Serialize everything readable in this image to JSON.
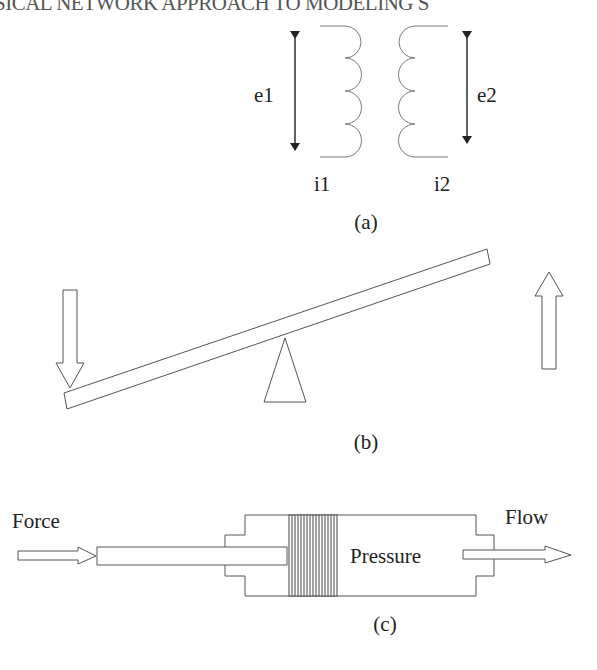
{
  "page": {
    "running_head": "SICAL NETWORK APPROACH TO MODELING S"
  },
  "figure": {
    "panel_a": {
      "caption": "(a)",
      "description": "transformer with two coupled coils",
      "labels": {
        "left_voltage": "e1",
        "right_voltage": "e2",
        "left_current": "i1",
        "right_current": "i2"
      }
    },
    "panel_b": {
      "caption": "(b)",
      "description": "lever on a fulcrum with downward input force on left end and upward output force on right end"
    },
    "panel_c": {
      "caption": "(c)",
      "description": "hydraulic piston: force pushes rod, piston produces pressure, fluid flows out",
      "labels": {
        "input": "Force",
        "chamber": "Pressure",
        "output": "Flow"
      }
    }
  },
  "colors": {
    "line": "#555555",
    "text": "#222222",
    "background": "#ffffff"
  }
}
